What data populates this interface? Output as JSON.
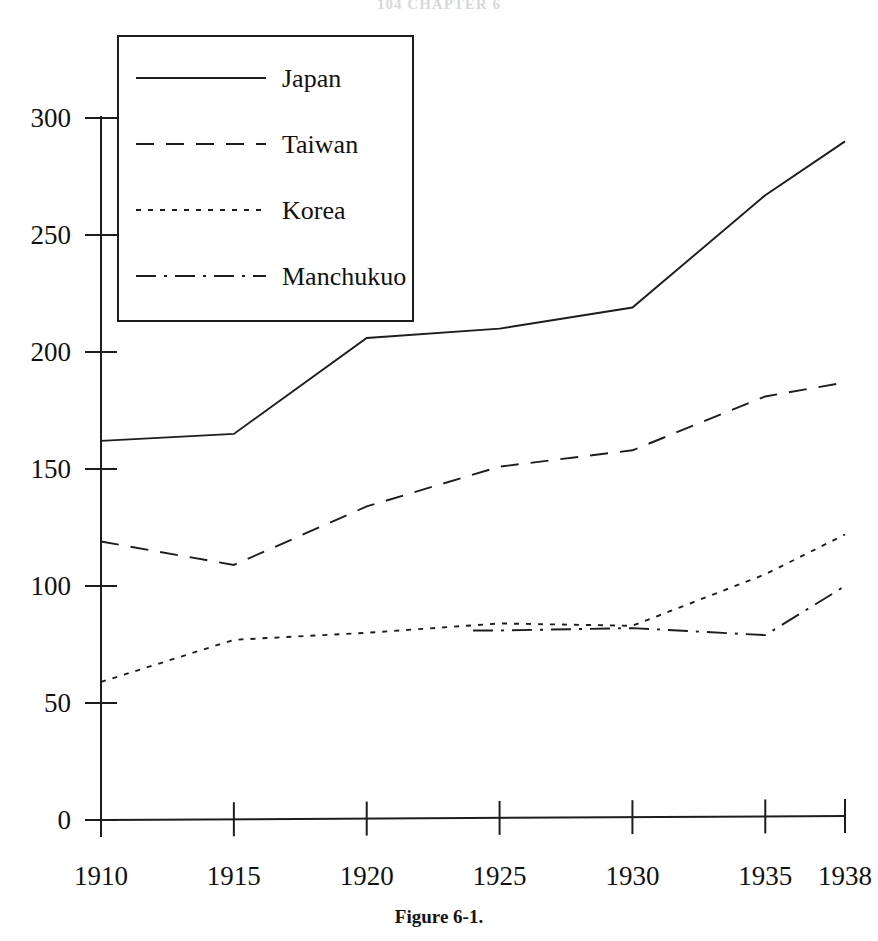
{
  "page": {
    "running_head": "104   CHAPTER 6",
    "caption": "Figure 6-1."
  },
  "chart_data": {
    "type": "line",
    "title": "",
    "subtitle": "",
    "xlabel": "",
    "ylabel": "",
    "x": [
      1910,
      1915,
      1920,
      1925,
      1930,
      1935,
      1938
    ],
    "categories": [
      "1910",
      "1915",
      "1920",
      "1925",
      "1930",
      "1935",
      "1938"
    ],
    "xlim": [
      1910,
      1938
    ],
    "ylim": [
      0,
      300
    ],
    "yticks": [
      0,
      50,
      100,
      150,
      200,
      250,
      300
    ],
    "ytick_labels": [
      "0",
      "50",
      "100",
      "150",
      "200",
      "250",
      "300"
    ],
    "xticks": [
      1910,
      1915,
      1920,
      1925,
      1930,
      1935,
      1938
    ],
    "xtick_labels": [
      "1910",
      "1915",
      "1920",
      "1925",
      "1930",
      "1935",
      "1938"
    ],
    "grid": false,
    "legend_position": "upper-left",
    "series": [
      {
        "name": "Japan",
        "style": "solid",
        "dash": "none",
        "color": "#1d1d1d",
        "x": [
          1910,
          1915,
          1920,
          1925,
          1930,
          1935,
          1938
        ],
        "values": [
          162,
          165,
          206,
          210,
          219,
          267,
          290
        ]
      },
      {
        "name": "Taiwan",
        "style": "dashed",
        "dash": "18 12",
        "color": "#1d1d1d",
        "x": [
          1910,
          1915,
          1920,
          1925,
          1930,
          1935,
          1938
        ],
        "values": [
          119,
          109,
          134,
          151,
          158,
          181,
          187
        ]
      },
      {
        "name": "Korea",
        "style": "dotted",
        "dash": "5 7",
        "color": "#1d1d1d",
        "x": [
          1910,
          1915,
          1920,
          1925,
          1930,
          1935,
          1938
        ],
        "values": [
          59,
          77,
          80,
          84,
          83,
          105,
          122
        ]
      },
      {
        "name": "Manchukuo",
        "style": "dash-dot",
        "dash": "20 8 3 8",
        "color": "#1d1d1d",
        "x": [
          1924,
          1925,
          1930,
          1935,
          1938
        ],
        "values": [
          81,
          81,
          82,
          79,
          100
        ]
      }
    ]
  },
  "legend": {
    "items": [
      {
        "label": "Japan"
      },
      {
        "label": "Taiwan"
      },
      {
        "label": "Korea"
      },
      {
        "label": "Manchukuo"
      }
    ]
  },
  "geometry": {
    "plot_left": 101,
    "plot_right": 845,
    "plot_top": 118,
    "plot_bottom": 820,
    "legend_x": 118,
    "legend_y": 36,
    "legend_w": 295,
    "legend_h": 285
  }
}
